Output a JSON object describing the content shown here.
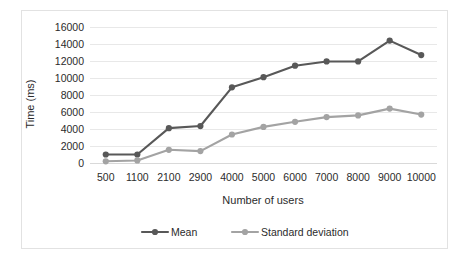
{
  "chart_data": {
    "type": "line",
    "title": "",
    "xlabel": "Number of users",
    "ylabel": "Time (ms)",
    "categories": [
      "500",
      "1100",
      "2100",
      "2900",
      "4000",
      "5000",
      "6000",
      "7000",
      "8000",
      "9000",
      "10000"
    ],
    "ylim": [
      0,
      16000
    ],
    "yticks": [
      "0",
      "2000",
      "4000",
      "6000",
      "8000",
      "10000",
      "12000",
      "14000",
      "16000"
    ],
    "ytick_values": [
      0,
      2000,
      4000,
      6000,
      8000,
      10000,
      12000,
      14000,
      16000
    ],
    "grid": true,
    "legend_position": "bottom",
    "series": [
      {
        "name": "Mean",
        "color": "#585858",
        "values": [
          1000,
          1000,
          4100,
          4350,
          8900,
          10100,
          11450,
          11950,
          11950,
          14400,
          12700
        ]
      },
      {
        "name": "Standard deviation",
        "color": "#a3a3a3",
        "values": [
          200,
          300,
          1550,
          1400,
          3350,
          4250,
          4850,
          5400,
          5600,
          6400,
          5700
        ]
      }
    ]
  },
  "legend": {
    "items": [
      {
        "label": "Mean",
        "color": "#585858"
      },
      {
        "label": "Standard deviation",
        "color": "#a3a3a3"
      }
    ]
  },
  "style": {
    "gridline_color": "#e8e8e8",
    "frame_color": "#e2e2e2",
    "text_color": "#2b2b2b",
    "background": "#ffffff"
  }
}
